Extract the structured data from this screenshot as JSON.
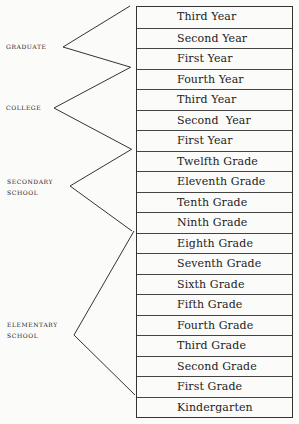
{
  "diagram": {
    "levels": [
      {
        "id": "graduate",
        "label_lines": [
          "Graduate"
        ]
      },
      {
        "id": "college",
        "label_lines": [
          "College"
        ]
      },
      {
        "id": "secondary",
        "label_lines": [
          "Secondary",
          "School"
        ]
      },
      {
        "id": "elementary",
        "label_lines": [
          "Elementary",
          "School"
        ]
      }
    ],
    "grades": [
      "Third Year",
      "Second Year",
      "First Year",
      "Fourth Year",
      "Third Year",
      "Second  Year",
      "First Year",
      "Twelfth Grade",
      "Eleventh Grade",
      "Tenth Grade",
      "Ninth Grade",
      "Eighth Grade",
      "Seventh Grade",
      "Sixth Grade",
      "Fifth Grade",
      "Fourth Grade",
      "Third Grade",
      "Second Grade",
      "First Grade",
      "Kindergarten"
    ],
    "line_color": "#333333"
  }
}
